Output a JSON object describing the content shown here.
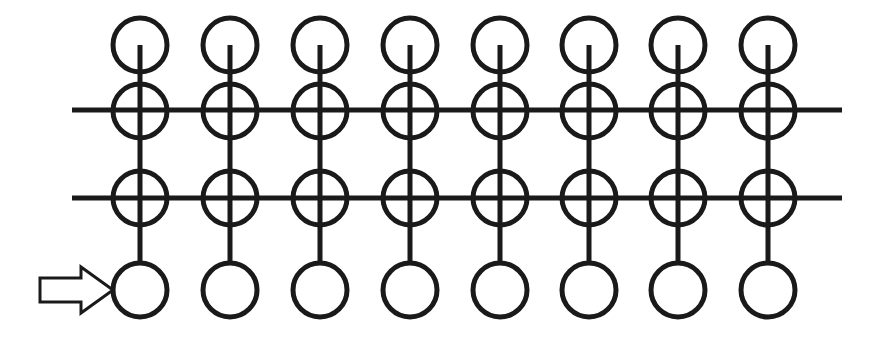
{
  "figure": {
    "background_color": "#ffffff",
    "stroke_color": "#1a1a1a",
    "canvas": {
      "width": 876,
      "height": 345
    }
  },
  "lattice": {
    "columns": 8,
    "rows": 4,
    "column_centers_x": [
      140,
      230,
      320,
      410,
      500,
      589,
      678,
      768
    ],
    "row_centers_y": [
      45,
      111,
      198,
      290
    ],
    "node_radius": 27,
    "node_stroke_width": 5,
    "node_fill": "none",
    "node_stroke_color": "#1a1a1a",
    "row_labels": [
      "row-1-top",
      "row-2",
      "row-3",
      "row-4-bottom"
    ]
  },
  "vertical_connectors": {
    "stroke_width": 5,
    "stroke_color": "#1a1a1a",
    "start_y": 45,
    "end_y": 263,
    "description": "Each column has one continuous vertical line from the center of the top circle down to the top of the bottom circle."
  },
  "horizontal_lines": [
    {
      "name": "upper-horizontal-line",
      "y": 110,
      "x_start": 72,
      "x_end": 842,
      "stroke_width": 5,
      "stroke_color": "#1a1a1a",
      "crosses_row": 2
    },
    {
      "name": "lower-horizontal-line",
      "y": 198,
      "x_start": 72,
      "x_end": 842,
      "stroke_width": 5,
      "stroke_color": "#1a1a1a",
      "crosses_row": 3
    }
  ],
  "arrow": {
    "name": "pointer-arrow",
    "direction": "right",
    "style": "hollow-outline",
    "fill": "none",
    "stroke_color": "#1a1a1a",
    "stroke_width": 3,
    "tip_x": 113,
    "tail_x": 40,
    "center_y": 290,
    "shaft_half_height": 12,
    "head_half_height": 23,
    "head_length": 32,
    "points_at": "bottom-left-node"
  }
}
